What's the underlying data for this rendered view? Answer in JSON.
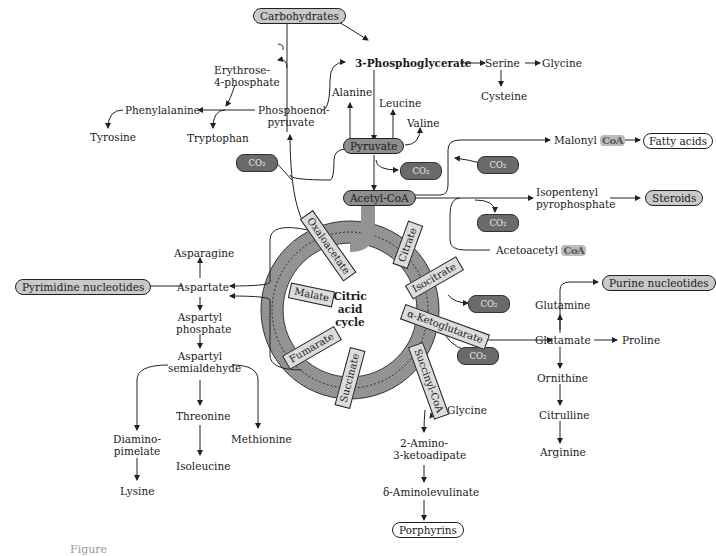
{
  "figure": {
    "center_label": [
      "Citric",
      "acid",
      "cycle"
    ],
    "cycle_intermediates": [
      {
        "label": "Citrate"
      },
      {
        "label": "Isocitrate"
      },
      {
        "label": "α-Ketoglutarate"
      },
      {
        "label": "Succinyl-CoA"
      },
      {
        "label": "Succinate"
      },
      {
        "label": "Fumarate"
      },
      {
        "label": "Malate"
      },
      {
        "label": "Oxaloacetate"
      }
    ],
    "end_products": {
      "carbohydrates": "Carbohydrates",
      "fatty_acids": "Fatty acids",
      "steroids": "Steroids",
      "pyrimidine_nucleotides": "Pyrimidine nucleotides",
      "purine_nucleotides": "Purine nucleotides",
      "porphyrins": "Porphyrins"
    },
    "hub_boxes": {
      "pyruvate": "Pyruvate",
      "acetyl_coa": "Acetyl-CoA"
    },
    "nodes": {
      "phosphoglycerate": "3-Phosphoglycerate",
      "serine": "Serine",
      "glycine_top": "Glycine",
      "cysteine": "Cysteine",
      "alanine": "Alanine",
      "leucine": "Leucine",
      "valine": "Valine",
      "erythrose_1": "Erythrose-",
      "erythrose_2": "4-phosphate",
      "phenylalanine": "Phenylalanine",
      "tyrosine": "Tyrosine",
      "tryptophan": "Tryptophan",
      "pep_1": "Phosphoenol-",
      "pep_2": "pyruvate",
      "malonyl": "Malonyl",
      "isopentenyl_1": "Isopentenyl",
      "isopentenyl_2": "pyrophosphate",
      "acetoacetyl": "Acetoacetyl",
      "asparagine": "Asparagine",
      "aspartate": "Aspartate",
      "aspartyl_p_1": "Aspartyl",
      "aspartyl_p_2": "phosphate",
      "aspartyl_s_1": "Aspartyl",
      "aspartyl_s_2": "semialdehyde",
      "threonine": "Threonine",
      "isoleucine": "Isoleucine",
      "methionine": "Methionine",
      "diamino_1": "Diamino-",
      "diamino_2": "pimelate",
      "lysine": "Lysine",
      "glutamine": "Glutamine",
      "glutamate": "Glutamate",
      "proline": "Proline",
      "ornithine": "Ornithine",
      "citrulline": "Citrulline",
      "arginine": "Arginine",
      "glycine_bottom": "Glycine",
      "amino_keto_1": "2-Amino-",
      "amino_keto_2": "3-ketoadipate",
      "ala_acid": "δ-Aminolevulinate"
    },
    "co2_label": "CO₂",
    "coa_label": "CoA",
    "caption": "Figure"
  }
}
